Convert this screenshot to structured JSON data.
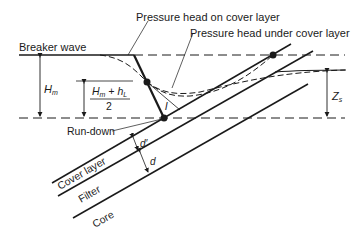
{
  "diagram": {
    "labels": {
      "breaker_wave": "Breaker wave",
      "pressure_on": "Pressure head on cover layer",
      "pressure_under": "Pressure head under cover layer",
      "run_down": "Run-down",
      "cover_layer": "Cover layer",
      "filter": "Filter",
      "core": "Core",
      "hm": "H",
      "hm_sub": "m",
      "frac_num": "H",
      "frac_num_sub1": "m",
      "frac_plus": " + h",
      "frac_num_sub2": "L",
      "frac_den": "2",
      "zs": "Z",
      "zs_sub": "s",
      "d_prime": "d′",
      "d": "d",
      "l": "l"
    },
    "colors": {
      "line": "#1a1a1a",
      "background": "#ffffff"
    }
  }
}
